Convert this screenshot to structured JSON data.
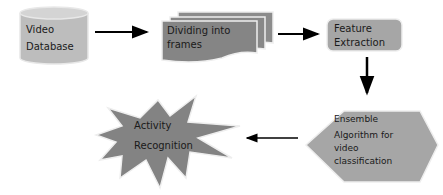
{
  "diagram": {
    "nodes": [
      {
        "id": "video-db",
        "shape": "cylinder",
        "lines": [
          "Video",
          "Database"
        ]
      },
      {
        "id": "dividing",
        "shape": "stacked-documents",
        "lines": [
          "Dividing into",
          "frames"
        ]
      },
      {
        "id": "feature",
        "shape": "rounded-rect",
        "lines": [
          "Feature",
          "Extraction"
        ]
      },
      {
        "id": "ensemble",
        "shape": "hexagon",
        "lines": [
          "Ensemble",
          "Algorithm for",
          "video",
          "classification"
        ]
      },
      {
        "id": "activity",
        "shape": "explosion",
        "lines": [
          "Activity",
          "Recognition"
        ]
      }
    ],
    "edges": [
      {
        "from": "video-db",
        "to": "dividing"
      },
      {
        "from": "dividing",
        "to": "feature"
      },
      {
        "from": "feature",
        "to": "ensemble"
      },
      {
        "from": "ensemble",
        "to": "activity"
      }
    ],
    "colors": {
      "node_fill": "#a6a6a6",
      "node_fill_dark": "#7f7f7f",
      "arrow": "#000000",
      "text": "#1a1a1a"
    }
  }
}
